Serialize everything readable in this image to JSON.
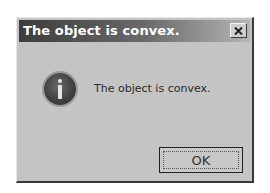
{
  "dialog": {
    "title": "The object is convex.",
    "close_icon": "close-x-icon",
    "icon": "information-icon",
    "message": "The object is convex.",
    "ok_label": "OK"
  },
  "colors": {
    "title_bar_start": "#3c3c3c",
    "title_bar_end": "#b5b5b5",
    "dialog_background": "#c4c4c4"
  }
}
